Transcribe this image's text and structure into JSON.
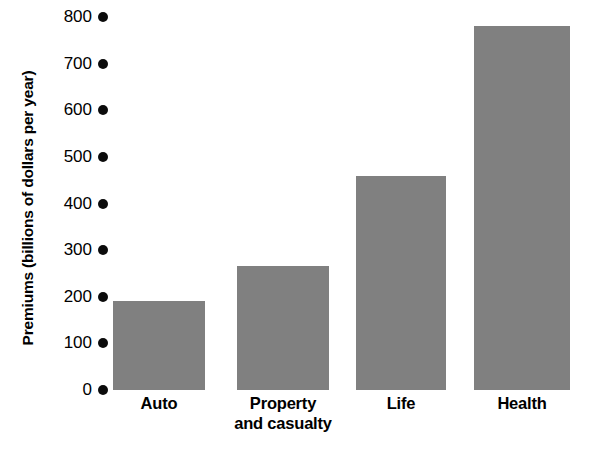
{
  "chart_data": {
    "type": "bar",
    "title": "",
    "subtitle": "",
    "xlabel": "",
    "ylabel": "Premiums (billions of dollars per year)",
    "categories": [
      "Auto",
      "Property and casualty",
      "Life",
      "Health"
    ],
    "category_lines": [
      [
        "Auto"
      ],
      [
        "Property",
        "and casualty"
      ],
      [
        "Life"
      ],
      [
        "Health"
      ]
    ],
    "values": [
      190,
      265,
      460,
      780
    ],
    "ylim": [
      0,
      800
    ],
    "ytick_values": [
      0,
      100,
      200,
      300,
      400,
      500,
      600,
      700,
      800
    ],
    "ytick_labels": [
      "0",
      "100",
      "200",
      "300",
      "400",
      "500",
      "600",
      "700",
      "800"
    ],
    "grid": false,
    "legend": false,
    "legend_position": "none",
    "bar_color": "#808080",
    "tick_marker": "filled-circle",
    "tick_marker_color": "#0b0b0b",
    "background_color": "#ffffff",
    "text_color": "#000000"
  },
  "axis": {
    "y_title": "Premiums (billions of dollars per year)"
  }
}
